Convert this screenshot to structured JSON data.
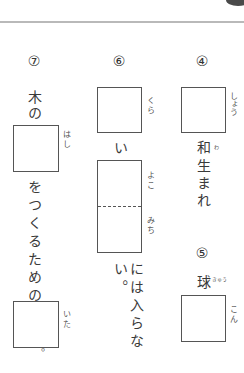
{
  "header": {
    "rule_color": "#b9b9b9"
  },
  "questions": [
    {
      "number": "⑦",
      "lead": "木の",
      "box1_reading": "はし",
      "middle": "をつくるための",
      "box2_reading": "いた",
      "tail": "。"
    },
    {
      "number": "⑥",
      "box1_reading": "くら",
      "connector": "い",
      "box2_reading_top": "よこ",
      "box2_reading_bottom": "みち",
      "tail": "には入らない。"
    },
    {
      "number": "④",
      "box_reading": "しょう",
      "tail_kanji1": "和",
      "tail_kanji1_reading": "わ",
      "tail_rest": "生まれ"
    },
    {
      "number": "⑤",
      "lead": "球",
      "lead_reading": "きゅう",
      "box_reading": "こん"
    }
  ]
}
